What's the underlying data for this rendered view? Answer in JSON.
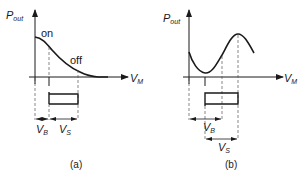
{
  "figure": {
    "panel_a": {
      "caption": "(a)",
      "y_axis_label": "P",
      "y_axis_sub": "out",
      "x_axis_label": "V",
      "x_axis_sub": "M",
      "curve_labels": {
        "on": "on",
        "off": "off"
      },
      "vb_label": "V",
      "vb_sub": "B",
      "vs_label": "V",
      "vs_sub": "S"
    },
    "panel_b": {
      "caption": "(b)",
      "y_axis_label": "P",
      "y_axis_sub": "out",
      "x_axis_label": "V",
      "x_axis_sub": "M",
      "vb_label": "V",
      "vb_sub": "B",
      "vs_label": "V",
      "vs_sub": "S"
    },
    "colors": {
      "ink": "#1a1a1a",
      "dash": "#555555"
    }
  }
}
